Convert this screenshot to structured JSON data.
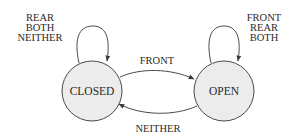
{
  "diagram": {
    "type": "state-machine",
    "colors": {
      "state_fill": "#ececec",
      "stroke": "#4a4a4a",
      "text": "#2a2a2a",
      "background": "#ffffff"
    },
    "states": [
      {
        "id": "closed",
        "label": "CLOSED"
      },
      {
        "id": "open",
        "label": "OPEN"
      }
    ],
    "transitions": {
      "closed_self": {
        "from": "CLOSED",
        "to": "CLOSED",
        "labels": [
          "REAR",
          "BOTH",
          "NEITHER"
        ]
      },
      "open_self": {
        "from": "OPEN",
        "to": "OPEN",
        "labels": [
          "FRONT",
          "REAR",
          "BOTH"
        ]
      },
      "closed_to_open": {
        "from": "CLOSED",
        "to": "OPEN",
        "label": "FRONT"
      },
      "open_to_closed": {
        "from": "OPEN",
        "to": "CLOSED",
        "label": "NEITHER"
      }
    }
  }
}
